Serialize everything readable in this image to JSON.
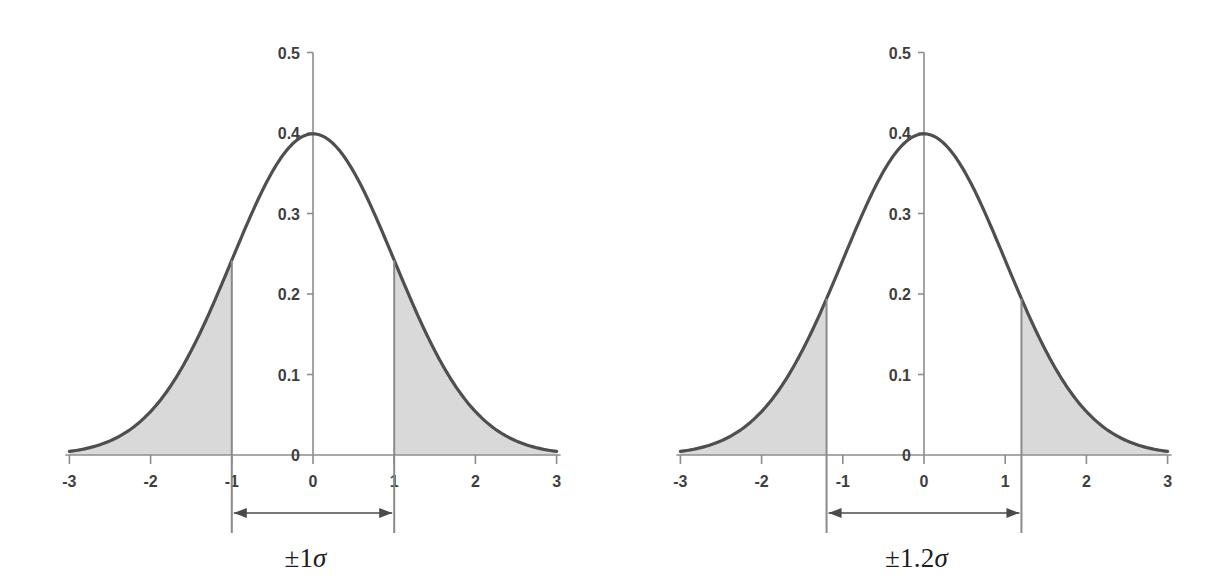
{
  "figure": {
    "background_color": "#ffffff",
    "curve_color": "#4f4f4f",
    "shade_color": "#d9d9d9",
    "axis_color": "#8c8c8c",
    "text_color": "#3f3f3f",
    "annotation_color": "#1d1d1d"
  },
  "charts": [
    {
      "id": "left-chart",
      "annotation_label": "±1σ",
      "annotation_plus_minus": "±",
      "annotation_number": "1",
      "annotation_sigma": "σ",
      "x_tick_labels": [
        "-3",
        "-2",
        "-1",
        "0",
        "1",
        "2",
        "3"
      ],
      "x_tick_values": [
        -3,
        -2,
        -1,
        0,
        1,
        2,
        3
      ],
      "y_tick_labels": [
        "0",
        "0.1",
        "0.2",
        "0.3",
        "0.4",
        "0.5"
      ],
      "y_tick_values": [
        0,
        0.1,
        0.2,
        0.3,
        0.4,
        0.5
      ],
      "boundary": 1,
      "boundary_label_left": "-1",
      "boundary_label_right": "1",
      "peak_value": "0.4"
    },
    {
      "id": "right-chart",
      "annotation_label": "±1.2σ",
      "annotation_plus_minus": "±",
      "annotation_number": "1.2",
      "annotation_sigma": "σ",
      "x_tick_labels": [
        "-3",
        "-2",
        "-1",
        "0",
        "1",
        "2",
        "3"
      ],
      "x_tick_values": [
        -3,
        -2,
        -1,
        0,
        1,
        2,
        3
      ],
      "y_tick_labels": [
        "0",
        "0.1",
        "0.2",
        "0.3",
        "0.4",
        "0.5"
      ],
      "y_tick_values": [
        0,
        0.1,
        0.2,
        0.3,
        0.4,
        0.5
      ],
      "boundary": 1.2,
      "boundary_label_left": "-1.2",
      "boundary_label_right": "1.2",
      "peak_value": "0.4"
    }
  ],
  "chart_data": [
    {
      "type": "area",
      "title": "",
      "subtitle": "",
      "xlabel": "",
      "ylabel": "",
      "xlim": [
        -3,
        3
      ],
      "ylim": [
        0,
        0.5
      ],
      "grid": false,
      "legend": "none",
      "annotations": [
        "±1σ"
      ],
      "xticks": [
        -3,
        -2,
        -1,
        0,
        1,
        2,
        3
      ],
      "xticklabels": [
        "-3",
        "-2",
        "-1",
        "0",
        "1",
        "2",
        "3"
      ],
      "yticks": [
        0,
        0.1,
        0.2,
        0.3,
        0.4,
        0.5
      ],
      "yticklabels": [
        "0",
        "0.1",
        "0.2",
        "0.3",
        "0.4",
        "0.5"
      ],
      "series": [
        {
          "name": "standard normal pdf",
          "description": "y = (1/sqrt(2*pi)) * exp(-x^2/2)",
          "x": [
            -3.0,
            -2.8,
            -2.6,
            -2.4,
            -2.2,
            -2.0,
            -1.8,
            -1.6,
            -1.4,
            -1.2,
            -1.0,
            -0.8,
            -0.6,
            -0.4,
            -0.2,
            0.0,
            0.2,
            0.4,
            0.6,
            0.8,
            1.0,
            1.2,
            1.4,
            1.6,
            1.8,
            2.0,
            2.2,
            2.4,
            2.6,
            2.8,
            3.0
          ],
          "values": [
            0.0044,
            0.0079,
            0.0136,
            0.0224,
            0.0355,
            0.054,
            0.079,
            0.1109,
            0.1497,
            0.1942,
            0.242,
            0.2897,
            0.3332,
            0.3683,
            0.391,
            0.3989,
            0.391,
            0.3683,
            0.3332,
            0.2897,
            0.242,
            0.1942,
            0.1497,
            0.1109,
            0.079,
            0.054,
            0.0355,
            0.0224,
            0.0136,
            0.0079,
            0.0044
          ]
        }
      ],
      "shaded_regions": [
        {
          "label": "left tail",
          "from": -3,
          "to": -1,
          "color": "#d9d9d9",
          "approx_area": 0.1587
        },
        {
          "label": "right tail",
          "from": 1,
          "to": 3,
          "color": "#d9d9d9",
          "approx_area": 0.1587
        }
      ],
      "boundary_lines": [
        -1,
        1
      ],
      "boundary_curve_values": [
        0.242,
        0.242
      ],
      "peak": {
        "x": 0,
        "y": 0.3989
      }
    },
    {
      "type": "area",
      "title": "",
      "subtitle": "",
      "xlabel": "",
      "ylabel": "",
      "xlim": [
        -3,
        3
      ],
      "ylim": [
        0,
        0.5
      ],
      "grid": false,
      "legend": "none",
      "annotations": [
        "±1.2σ"
      ],
      "xticks": [
        -3,
        -2,
        -1,
        0,
        1,
        2,
        3
      ],
      "xticklabels": [
        "-3",
        "-2",
        "-1",
        "0",
        "1",
        "2",
        "3"
      ],
      "yticks": [
        0,
        0.1,
        0.2,
        0.3,
        0.4,
        0.5
      ],
      "yticklabels": [
        "0",
        "0.1",
        "0.2",
        "0.3",
        "0.4",
        "0.5"
      ],
      "series": [
        {
          "name": "standard normal pdf",
          "description": "y = (1/sqrt(2*pi)) * exp(-x^2/2)",
          "x": [
            -3.0,
            -2.8,
            -2.6,
            -2.4,
            -2.2,
            -2.0,
            -1.8,
            -1.6,
            -1.4,
            -1.2,
            -1.0,
            -0.8,
            -0.6,
            -0.4,
            -0.2,
            0.0,
            0.2,
            0.4,
            0.6,
            0.8,
            1.0,
            1.2,
            1.4,
            1.6,
            1.8,
            2.0,
            2.2,
            2.4,
            2.6,
            2.8,
            3.0
          ],
          "values": [
            0.0044,
            0.0079,
            0.0136,
            0.0224,
            0.0355,
            0.054,
            0.079,
            0.1109,
            0.1497,
            0.1942,
            0.242,
            0.2897,
            0.3332,
            0.3683,
            0.391,
            0.3989,
            0.391,
            0.3683,
            0.3332,
            0.2897,
            0.242,
            0.1942,
            0.1497,
            0.1109,
            0.079,
            0.054,
            0.0355,
            0.0224,
            0.0136,
            0.0079,
            0.0044
          ]
        }
      ],
      "shaded_regions": [
        {
          "label": "left tail",
          "from": -3,
          "to": -1.2,
          "color": "#d9d9d9",
          "approx_area": 0.1151
        },
        {
          "label": "right tail",
          "from": 1.2,
          "to": 3,
          "color": "#d9d9d9",
          "approx_area": 0.1151
        }
      ],
      "boundary_lines": [
        -1.2,
        1.2
      ],
      "boundary_curve_values": [
        0.1942,
        0.1942
      ],
      "peak": {
        "x": 0,
        "y": 0.3989
      }
    }
  ]
}
